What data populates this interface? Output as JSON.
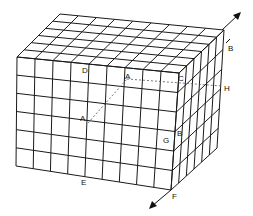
{
  "diagram": {
    "labels": {
      "D": "D",
      "A_top": "A",
      "C": "C",
      "H": "H",
      "A_mid": "A",
      "B_side": "B",
      "G": "G",
      "E": "E",
      "F": "F",
      "B_vector": "B"
    },
    "geometry": {
      "front_cols": 9,
      "front_rows": 6,
      "depth_cells": 6,
      "top_back_left": [
        60,
        14
      ],
      "top_back_right": [
        224,
        30
      ],
      "front_top_left": [
        17,
        57
      ],
      "front_top_right": [
        179,
        73
      ],
      "front_bottom_left": [
        16,
        166
      ],
      "front_bottom_right": [
        171,
        190
      ],
      "back_bottom_right": [
        217,
        148
      ]
    },
    "colors": {
      "line": "#1a1a1a",
      "background": "#ffffff"
    }
  }
}
